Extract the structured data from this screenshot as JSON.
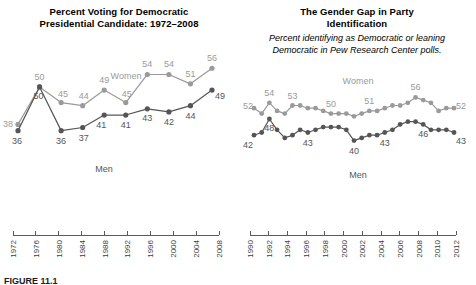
{
  "figure": {
    "caption": "FIGURE 11.1"
  },
  "colors": {
    "women": "#9a9a9a",
    "men": "#555555",
    "axis": "#5a5a5a",
    "text": "#000000",
    "background": "#ffffff"
  },
  "panels": {
    "left": {
      "title_line1": "Percent Voting for Democratic",
      "title_line2": "Presidential Candidate: 1972–2008",
      "women_label": "Women",
      "men_label": "Men"
    },
    "right": {
      "title_line1": "The Gender Gap in Party",
      "title_line2": "Identification",
      "subtitle_line1": "Percent identifying as Democratic or leaning",
      "subtitle_line2": "Democratic in Pew Research Center polls.",
      "women_label": "Women",
      "men_label": "Men"
    }
  },
  "chart_data": [
    {
      "id": "presidential-vote",
      "type": "line",
      "title": "Percent Voting for Democratic Presidential Candidate: 1972–2008",
      "xlabel": "",
      "ylabel": "",
      "ylim": [
        33,
        58
      ],
      "xlim": [
        1972,
        2008
      ],
      "grid": false,
      "legend": "inline-series-labels",
      "x": [
        1972,
        1976,
        1980,
        1984,
        1988,
        1992,
        1996,
        2000,
        2004,
        2008
      ],
      "categories": [
        "1972",
        "1976",
        "1980",
        "1984",
        "1988",
        "1992",
        "1996",
        "2000",
        "2004",
        "2008"
      ],
      "series": [
        {
          "name": "Women",
          "color": "#9a9a9a",
          "values": [
            38,
            50,
            45,
            44,
            49,
            45,
            54,
            54,
            51,
            56
          ],
          "labels": [
            "38",
            "50",
            "45",
            "44",
            "49",
            "45",
            "54",
            "54",
            "51",
            "56"
          ],
          "label_positions": [
            "below-left",
            "above",
            "above",
            "above",
            "above",
            "above",
            "above",
            "above",
            "above",
            "above"
          ]
        },
        {
          "name": "Men",
          "color": "#555555",
          "values": [
            36,
            50,
            36,
            37,
            41,
            41,
            43,
            42,
            44,
            49
          ],
          "labels": [
            "36",
            "50",
            "36",
            "37",
            "41",
            "41",
            "43",
            "42",
            "44",
            "49"
          ],
          "label_positions": [
            "below",
            "above-right",
            "below",
            "below",
            "below",
            "below",
            "below",
            "below",
            "below",
            "right"
          ]
        }
      ]
    },
    {
      "id": "party-identification",
      "type": "line",
      "title": "The Gender Gap in Party Identification",
      "subtitle": "Percent identifying as Democratic or leaning Democratic in Pew Research Center polls.",
      "xlabel": "",
      "ylabel": "",
      "ylim": [
        38,
        58
      ],
      "xlim": [
        1990,
        2012
      ],
      "grid": false,
      "legend": "inline-series-labels",
      "categories": [
        "1990",
        "1992",
        "1994",
        "1996",
        "1998",
        "2000",
        "2002",
        "2004",
        "2006",
        "2008",
        "2010",
        "2012"
      ],
      "series": [
        {
          "name": "Women",
          "color": "#9a9a9a",
          "values": [
            52,
            50,
            54,
            51,
            50,
            53,
            53,
            52,
            52,
            51,
            50,
            50,
            50,
            49,
            50,
            51,
            51,
            52,
            53,
            53,
            54,
            56,
            55,
            54,
            51,
            52,
            52
          ],
          "annotated_labels": [
            {
              "index": 0,
              "text": "52"
            },
            {
              "index": 2,
              "text": "54"
            },
            {
              "index": 5,
              "text": "53"
            },
            {
              "index": 10,
              "text": "50"
            },
            {
              "index": 15,
              "text": "51"
            },
            {
              "index": 21,
              "text": "56"
            },
            {
              "index": 26,
              "text": "52"
            }
          ]
        },
        {
          "name": "Men",
          "color": "#555555",
          "values": [
            42,
            43,
            48,
            44,
            41,
            42,
            44,
            43,
            44,
            45,
            45,
            45,
            44,
            40,
            41,
            42,
            42,
            43,
            44,
            46,
            47,
            47,
            46,
            44,
            44,
            44,
            43
          ],
          "annotated_labels": [
            {
              "index": 0,
              "text": "42"
            },
            {
              "index": 2,
              "text": "48"
            },
            {
              "index": 7,
              "text": "43"
            },
            {
              "index": 13,
              "text": "40"
            },
            {
              "index": 17,
              "text": "43"
            },
            {
              "index": 22,
              "text": "46"
            },
            {
              "index": 26,
              "text": "43"
            }
          ]
        }
      ]
    }
  ]
}
